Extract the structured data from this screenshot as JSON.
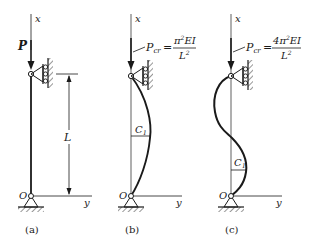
{
  "figure": {
    "type": "column buckling diagram",
    "panels": [
      {
        "id": "a",
        "caption": "(a)",
        "axis_x_label": "x",
        "axis_y_label": "y",
        "origin_label": "O",
        "load_label": "P",
        "length_label": "L",
        "shape": "straight"
      },
      {
        "id": "b",
        "caption": "(b)",
        "axis_x_label": "x",
        "axis_y_label": "y",
        "origin_label": "O",
        "load_symbol": "P",
        "load_subscript": "cr",
        "equals": "=",
        "numerator": "π²EI",
        "numerator_parts": {
          "coef": "",
          "pi": "π",
          "sup": "2",
          "rest": "EI"
        },
        "denominator": "L²",
        "denominator_parts": {
          "base": "L",
          "sup": "2"
        },
        "deflection_label": "C",
        "deflection_subscript": "1",
        "shape": "half sine wave"
      },
      {
        "id": "c",
        "caption": "(c)",
        "axis_x_label": "x",
        "axis_y_label": "y",
        "origin_label": "O",
        "load_symbol": "P",
        "load_subscript": "cr",
        "equals": "=",
        "numerator": "4π²EI",
        "numerator_parts": {
          "coef": "4",
          "pi": "π",
          "sup": "2",
          "rest": "EI"
        },
        "denominator": "L²",
        "denominator_parts": {
          "base": "L",
          "sup": "2"
        },
        "deflection_label": "C",
        "deflection_subscript": "1",
        "shape": "full sine wave"
      }
    ],
    "colors": {
      "ink": "#1a1a1a",
      "background": "#ffffff"
    }
  }
}
